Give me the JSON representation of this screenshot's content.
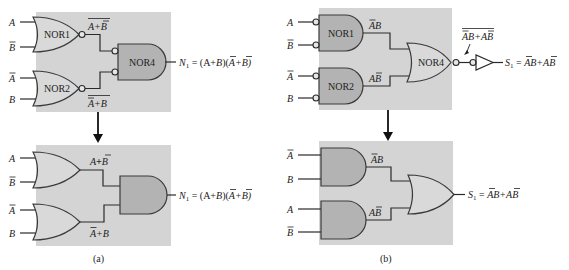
{
  "figure": {
    "part_a": {
      "caption": "(a)",
      "top": {
        "gates": [
          {
            "name": "NOR1",
            "shape": "OR with output bubble",
            "inputs": [
              "A",
              "B̄"
            ],
            "output_label": "A+B̄",
            "output_overlined": true
          },
          {
            "name": "NOR2",
            "shape": "OR with output bubble",
            "inputs": [
              "Ā",
              "B"
            ],
            "output_label": "Ā+B",
            "output_overlined": true
          },
          {
            "name": "NOR4",
            "shape": "AND with input bubbles",
            "inputs": [
              "NOR1",
              "NOR2"
            ]
          }
        ],
        "output_expression": "N₁ = (A+B̄)(Ā+B)"
      },
      "bottom": {
        "gates": [
          {
            "name": "",
            "shape": "OR",
            "inputs": [
              "A",
              "B̄"
            ],
            "output_label": "A+B̄"
          },
          {
            "name": "",
            "shape": "OR",
            "inputs": [
              "Ā",
              "B"
            ],
            "output_label": "Ā+B"
          },
          {
            "name": "",
            "shape": "AND",
            "inputs": [
              "A+B̄",
              "Ā+B"
            ]
          }
        ],
        "output_expression": "N₁ = (A+B̄)(Ā+B)"
      }
    },
    "part_b": {
      "caption": "(b)",
      "top": {
        "gates": [
          {
            "name": "NOR1",
            "shape": "AND with input bubbles",
            "inputs": [
              "A",
              "B̄"
            ],
            "output_label": "ĀB"
          },
          {
            "name": "NOR2",
            "shape": "AND with input bubbles",
            "inputs": [
              "Ā",
              "B"
            ],
            "output_label": "AB̄"
          },
          {
            "name": "NOR4",
            "shape": "OR with output bubble",
            "inputs": [
              "ĀB",
              "AB̄"
            ]
          },
          {
            "name": "",
            "shape": "inverter (bubble input)",
            "inputs": [
              "ĀB+AB̄ (overlined)"
            ]
          }
        ],
        "intermediate_label": "ĀB+AB̄",
        "output_expression": "S₁ = ĀB+AB̄"
      },
      "bottom": {
        "gates": [
          {
            "name": "",
            "shape": "AND",
            "inputs": [
              "Ā",
              "B"
            ],
            "output_label": "ĀB"
          },
          {
            "name": "",
            "shape": "AND",
            "inputs": [
              "A",
              "B̄"
            ],
            "output_label": "AB̄"
          },
          {
            "name": "",
            "shape": "OR",
            "inputs": [
              "ĀB",
              "AB̄"
            ]
          }
        ],
        "output_expression": "S₁ = ĀB+AB̄"
      }
    }
  },
  "labels": {
    "A": "A",
    "B": "B",
    "nor1": "NOR1",
    "nor2": "NOR2",
    "nor4": "NOR4",
    "a_top_nor1_out": "A+B",
    "a_top_nor2_out": "A+B",
    "a_bot_or1_out_A": "A",
    "a_bot_or1_out_plus": "+",
    "a_bot_or1_out_B": "B",
    "a_bot_or2_out_A": "A",
    "a_bot_or2_out_plus": "+",
    "a_bot_or2_out_B": "B",
    "N1": "N",
    "N1_sub": "1",
    "N1_rhs_1": " = (A+",
    "N1_rhs_B": "B",
    "N1_rhs_2": ")(",
    "N1_rhs_A": "A",
    "N1_rhs_3": "+B)",
    "S1": "S",
    "S1_sub": "1",
    "S1_rhs_eq": " = ",
    "S1_rhs_A": "A",
    "S1_rhs_mid": "B+A",
    "S1_rhs_B": "B",
    "b_ab": "AB",
    "caption_a": "(a)",
    "caption_b": "(b)"
  },
  "colors": {
    "panel": "#d4d4d4",
    "gate_light": "#d9d9d9",
    "gate_dark": "#b3b3b3",
    "line": "#2a2a2a"
  }
}
